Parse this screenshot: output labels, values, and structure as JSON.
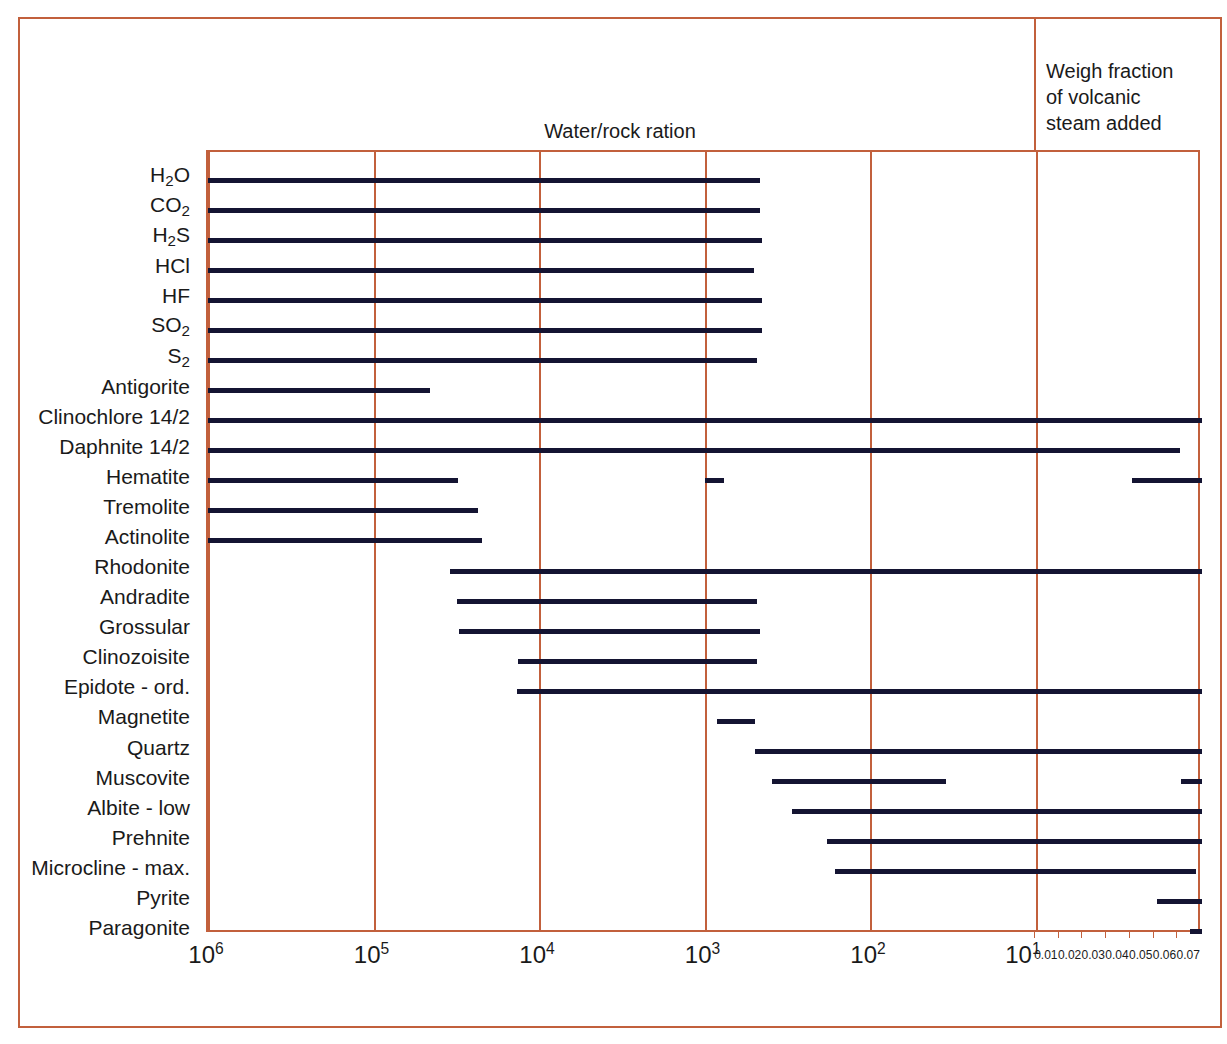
{
  "note": {
    "line1": "Weigh fraction",
    "line2": "of volcanic",
    "line3": "steam added"
  },
  "axis": {
    "log_ticks": [
      "10",
      "10",
      "10",
      "10",
      "10",
      "10"
    ],
    "log_exponents": [
      "6",
      "5",
      "4",
      "3",
      "2",
      "1"
    ],
    "linear_ticks": [
      "0.01",
      "0.02",
      "0.03",
      "0.04",
      "0.05",
      "0.06",
      "0.07"
    ]
  },
  "colors": {
    "frame": "#c2603c",
    "bar": "#141432",
    "text": "#1a1a1a",
    "background": "#ffffff"
  },
  "chart_data": {
    "type": "bar",
    "title": "Water/rock ration",
    "xlabel": "Water/rock ration",
    "ylabel": "",
    "orientation": "horizontal",
    "x_scale": "log-reversed + linear-right-panel",
    "x_log_range": [
      1000000,
      10
    ],
    "x_linear_range": [
      0.01,
      0.07
    ],
    "grid": true,
    "legend": "none",
    "note": "Weigh fraction of volcanic steam added",
    "categories": [
      "H2O",
      "CO2",
      "H2S",
      "HCl",
      "HF",
      "SO2",
      "S2",
      "Antigorite",
      "Clinochlore 14/2",
      "Daphnite 14/2",
      "Hematite",
      "Tremolite",
      "Actinolite",
      "Rhodonite",
      "Andradite",
      "Grossular",
      "Clinozoisite",
      "Epidote - ord.",
      "Magnetite",
      "Quartz",
      "Muscovite",
      "Albite - low",
      "Prehnite",
      "Microcline - max.",
      "Pyrite",
      "Paragonite"
    ],
    "category_labels": [
      "H<sub>2</sub>O",
      "CO<sub>2</sub>",
      "H<sub>2</sub>S",
      "HCl",
      "HF",
      "SO<sub>2</sub>",
      "S<sub>2</sub>",
      "Antigorite",
      "Clinochlore 14/2",
      "Daphnite 14/2",
      "Hematite",
      "Tremolite",
      "Actinolite",
      "Rhodonite",
      "Andradite",
      "Grossular",
      "Clinozoisite",
      "Epidote - ord.",
      "Magnetite",
      "Quartz",
      "Muscovite",
      "Albite - low",
      "Prehnite",
      "Microcline - max.",
      "Pyrite",
      "Paragonite"
    ],
    "series": [
      {
        "name": "H2O",
        "segments": [
          [
            0.0,
            0.5553
          ]
        ]
      },
      {
        "name": "CO2",
        "segments": [
          [
            0.0,
            0.5553
          ]
        ]
      },
      {
        "name": "H2S",
        "segments": [
          [
            0.0,
            0.5573
          ]
        ]
      },
      {
        "name": "HCl",
        "segments": [
          [
            0.0,
            0.5493
          ]
        ]
      },
      {
        "name": "HF",
        "segments": [
          [
            0.0,
            0.5573
          ]
        ]
      },
      {
        "name": "SO2",
        "segments": [
          [
            0.0,
            0.5573
          ]
        ]
      },
      {
        "name": "S2",
        "segments": [
          [
            0.0,
            0.5523
          ]
        ]
      },
      {
        "name": "Antigorite",
        "segments": [
          [
            0.0,
            0.2234
          ]
        ]
      },
      {
        "name": "Clinochlore 14/2",
        "segments": [
          [
            0.0,
            1.0
          ]
        ]
      },
      {
        "name": "Daphnite 14/2",
        "segments": [
          [
            0.0,
            0.9779
          ]
        ]
      },
      {
        "name": "Hematite",
        "segments": [
          [
            0.0,
            0.2515
          ],
          [
            0.5001,
            0.5191
          ],
          [
            0.9296,
            1.0
          ]
        ]
      },
      {
        "name": "Tremolite",
        "segments": [
          [
            0.0,
            0.2716
          ]
        ]
      },
      {
        "name": "Actinolite",
        "segments": [
          [
            0.0,
            0.2757
          ]
        ]
      },
      {
        "name": "Rhodonite",
        "segments": [
          [
            0.2435,
            1.0
          ]
        ]
      },
      {
        "name": "Andradite",
        "segments": [
          [
            0.2505,
            0.5523
          ]
        ]
      },
      {
        "name": "Grossular",
        "segments": [
          [
            0.2525,
            0.5553
          ]
        ]
      },
      {
        "name": "Clinozoisite",
        "segments": [
          [
            0.3119,
            0.5523
          ]
        ]
      },
      {
        "name": "Epidote - ord.",
        "segments": [
          [
            0.3109,
            1.0
          ]
        ]
      },
      {
        "name": "Magnetite",
        "segments": [
          [
            0.5121,
            0.5503
          ]
        ]
      },
      {
        "name": "Quartz",
        "segments": [
          [
            0.5503,
            1.0
          ]
        ]
      },
      {
        "name": "Muscovite",
        "segments": [
          [
            0.5674,
            0.7425
          ],
          [
            0.9789,
            1.0
          ]
        ]
      },
      {
        "name": "Albite - low",
        "segments": [
          [
            0.5875,
            1.0
          ]
        ]
      },
      {
        "name": "Prehnite",
        "segments": [
          [
            0.6227,
            1.0
          ]
        ]
      },
      {
        "name": "Microcline - max.",
        "segments": [
          [
            0.6308,
            0.994
          ]
        ]
      },
      {
        "name": "Pyrite",
        "segments": [
          [
            0.9548,
            1.0
          ]
        ]
      },
      {
        "name": "Paragonite",
        "segments": [
          [
            0.9879,
            1.0
          ]
        ]
      }
    ]
  }
}
